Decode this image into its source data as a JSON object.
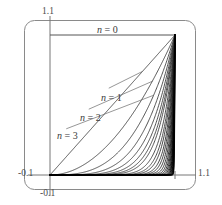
{
  "figure": {
    "name": "power-functions-plot",
    "background": "#ffffff",
    "frame": {
      "stroke": "#8a8a8a",
      "corner_radius": 10,
      "x": 24,
      "y": 20,
      "width": 172,
      "height": 170
    }
  },
  "axes": {
    "x_label_min": "-0.1",
    "x_label_max": "1.1",
    "y_label_min": "-0.1",
    "y_label_max": "1.1",
    "x_axis_color": "#777777",
    "y_axis_color": "#777777",
    "origin_px": {
      "x": 50,
      "y": 175
    },
    "unit_px": {
      "x": 125,
      "y": 140
    }
  },
  "labels": {
    "n0": {
      "var": "n",
      "eq": " = 0"
    },
    "n1": {
      "var": "n",
      "eq": " = 1"
    },
    "n2": {
      "var": "n",
      "eq": " = 2"
    },
    "n3": {
      "var": "n",
      "eq": " = 3"
    }
  },
  "chart_data": {
    "type": "line",
    "title": "",
    "xlabel": "",
    "ylabel": "",
    "xlim": [
      -0.1,
      1.1
    ],
    "ylim": [
      -0.1,
      1.1
    ],
    "xticks": [
      -0.1,
      1.1
    ],
    "xticklabels": [
      "-0.1",
      "1.1"
    ],
    "yticks": [
      -0.1,
      1.1
    ],
    "yticklabels": [
      "-0.1",
      "1.1"
    ],
    "grid": false,
    "legend": "inline-annotations",
    "function": "y = x^n on 0 <= x <= 1",
    "series": [
      {
        "name": "n = 0",
        "n": 0,
        "color": "#555555",
        "annotated": true
      },
      {
        "name": "n = 1",
        "n": 1,
        "color": "#333333",
        "annotated": true
      },
      {
        "name": "n = 2",
        "n": 2,
        "color": "#333333",
        "annotated": true
      },
      {
        "name": "n = 3",
        "n": 3,
        "color": "#333333",
        "annotated": true
      },
      {
        "name": "n = 4",
        "n": 4,
        "color": "#333333",
        "annotated": false
      },
      {
        "name": "n = 5",
        "n": 5,
        "color": "#333333",
        "annotated": false
      },
      {
        "name": "n = 6",
        "n": 6,
        "color": "#333333",
        "annotated": false
      },
      {
        "name": "n = 7",
        "n": 7,
        "color": "#333333",
        "annotated": false
      },
      {
        "name": "n = 8",
        "n": 8,
        "color": "#333333",
        "annotated": false
      },
      {
        "name": "n = 10",
        "n": 10,
        "color": "#333333",
        "annotated": false
      },
      {
        "name": "n = 12",
        "n": 12,
        "color": "#333333",
        "annotated": false
      },
      {
        "name": "n = 14",
        "n": 14,
        "color": "#222222",
        "annotated": false
      },
      {
        "name": "n = 17",
        "n": 17,
        "color": "#222222",
        "annotated": false
      },
      {
        "name": "n = 20",
        "n": 20,
        "color": "#222222",
        "annotated": false
      },
      {
        "name": "n = 24",
        "n": 24,
        "color": "#1a1a1a",
        "annotated": false
      },
      {
        "name": "n = 29",
        "n": 29,
        "color": "#1a1a1a",
        "annotated": false
      },
      {
        "name": "n = 35",
        "n": 35,
        "color": "#141414",
        "annotated": false
      },
      {
        "name": "n = 42",
        "n": 42,
        "color": "#141414",
        "annotated": false
      },
      {
        "name": "n = 50",
        "n": 50,
        "color": "#101010",
        "annotated": false
      },
      {
        "name": "n = 60",
        "n": 60,
        "color": "#101010",
        "annotated": false
      },
      {
        "name": "n = 72",
        "n": 72,
        "color": "#0a0a0a",
        "annotated": false
      },
      {
        "name": "n = 86",
        "n": 86,
        "color": "#0a0a0a",
        "annotated": false
      },
      {
        "name": "n = 100",
        "n": 100,
        "color": "#000000",
        "annotated": false
      },
      {
        "name": "n = 120",
        "n": 120,
        "color": "#000000",
        "annotated": false
      },
      {
        "name": "n = 145",
        "n": 145,
        "color": "#000000",
        "annotated": false
      },
      {
        "name": "n = 175",
        "n": 175,
        "color": "#000000",
        "annotated": false
      },
      {
        "name": "n = 210",
        "n": 210,
        "color": "#000000",
        "annotated": false
      },
      {
        "name": "n = 255",
        "n": 255,
        "color": "#000000",
        "annotated": false
      },
      {
        "name": "n = 310",
        "n": 310,
        "color": "#000000",
        "annotated": false
      },
      {
        "name": "n = 380",
        "n": 380,
        "color": "#000000",
        "annotated": false
      }
    ],
    "annotations": [
      {
        "text": "n = 0",
        "at_x": 0.4,
        "at_y": 1.06,
        "leader": false
      },
      {
        "text": "n = 1",
        "at_x": 0.47,
        "at_y": 0.62,
        "leader": true,
        "leader_to_x": 0.74,
        "leader_to_y": 0.74
      },
      {
        "text": "n = 2",
        "at_x": 0.31,
        "at_y": 0.47,
        "leader": true,
        "leader_to_x": 0.82,
        "leader_to_y": 0.67
      },
      {
        "text": "n = 3",
        "at_x": 0.13,
        "at_y": 0.33,
        "leader": true,
        "leader_to_x": 0.83,
        "leader_to_y": 0.57
      }
    ]
  }
}
